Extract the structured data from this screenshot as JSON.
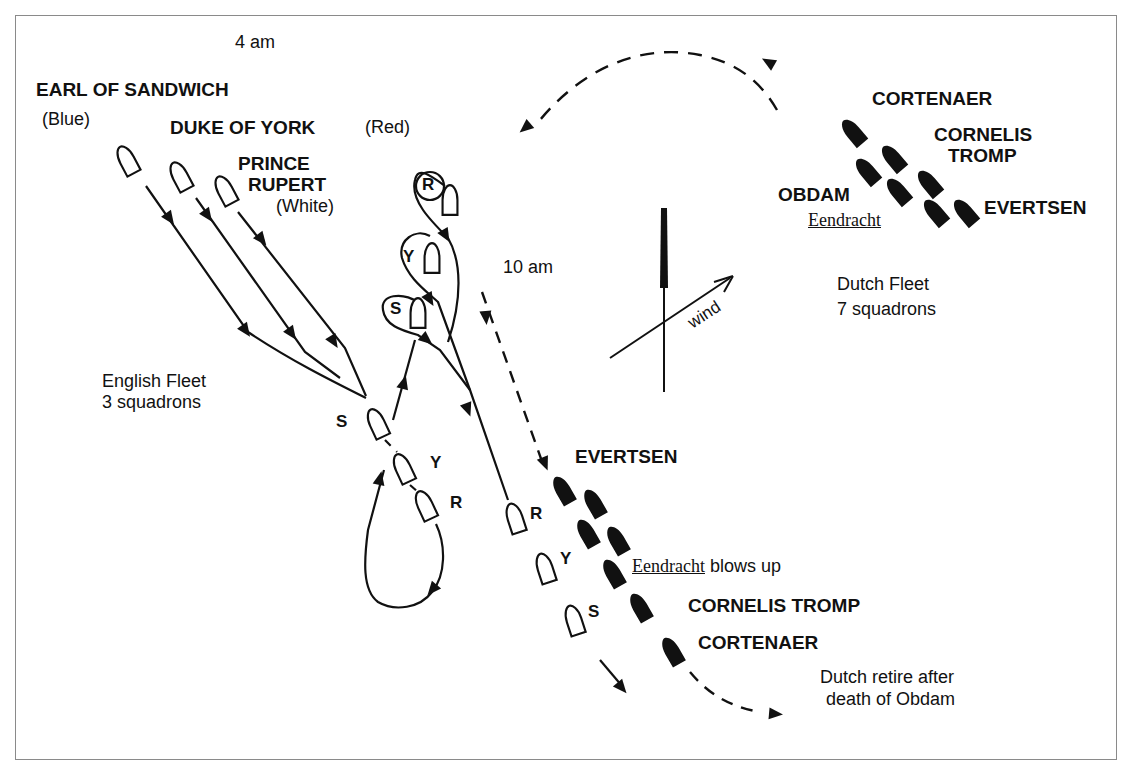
{
  "diagram": {
    "type": "naval-battle-map",
    "time_labels": {
      "start": "4 am",
      "mid": "10 am"
    },
    "english": {
      "fleet_label_line1": "English Fleet",
      "fleet_label_line2": "3  squadrons",
      "commanders": [
        {
          "name": "EARL OF SANDWICH",
          "squadron": "(Blue)"
        },
        {
          "name": "DUKE OF YORK",
          "squadron": "(Red)"
        },
        {
          "name_line1": "PRINCE",
          "name_line2": "RUPERT",
          "squadron": "(White)"
        }
      ],
      "squadron_codes": {
        "sandwich": "S",
        "york": "Y",
        "rupert": "R"
      }
    },
    "dutch": {
      "fleet_label_line1": "Dutch Fleet",
      "fleet_label_line2": "7 squadrons",
      "initial_labels": {
        "cortenaer": "CORTENAER",
        "tromp_line1": "CORNELIS",
        "tromp_line2": "TROMP",
        "obdam": "OBDAM",
        "eendracht": "Eendracht",
        "evertsen": "EVERTSEN"
      },
      "battle_labels": {
        "evertsen": "EVERTSEN",
        "eendracht": "Eendracht",
        "eendracht_event": " blows up",
        "tromp": "CORNELIS TROMP",
        "cortenaer": "CORTENAER"
      },
      "retreat_line1": "Dutch retire after",
      "retreat_line2": "death of Obdam"
    },
    "wind": {
      "label": "wind"
    },
    "colors": {
      "ink": "#111111",
      "frame": "#8a8a8a",
      "background": "#ffffff"
    }
  }
}
